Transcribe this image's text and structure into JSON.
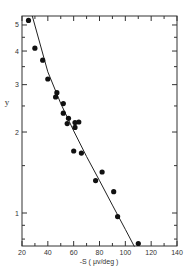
{
  "chart_data": {
    "type": "scatter",
    "title": "",
    "xlabel": "-S ( μv/deg )",
    "ylabel": "y",
    "xlim": [
      20,
      140
    ],
    "ylim": [
      0.75,
      5.4
    ],
    "yscale": "log",
    "grid": false,
    "legend": null,
    "x_ticks": [
      20,
      40,
      60,
      80,
      100,
      120,
      140
    ],
    "x_tick_labels": [
      "20",
      "40",
      "60",
      "80",
      "100",
      "120",
      "140"
    ],
    "y_ticks": [
      1,
      2,
      3,
      4,
      5
    ],
    "y_tick_labels": [
      "1",
      "2",
      "3",
      "4",
      "5"
    ],
    "series": [
      {
        "name": "data",
        "kind": "scatter",
        "x": [
          25,
          30,
          36,
          40,
          46,
          47,
          52,
          52,
          56,
          55,
          61,
          64,
          61,
          60,
          66,
          82,
          77,
          91,
          94,
          110
        ],
        "y": [
          5.2,
          4.1,
          3.7,
          3.15,
          2.7,
          2.8,
          2.55,
          2.35,
          2.25,
          2.15,
          2.17,
          2.18,
          2.08,
          1.7,
          1.67,
          1.42,
          1.32,
          1.2,
          0.97,
          0.77
        ]
      },
      {
        "name": "fit",
        "kind": "line",
        "x": [
          28,
          40,
          50,
          60,
          70,
          80,
          90,
          100,
          107
        ],
        "y": [
          5.4,
          3.35,
          2.55,
          2.02,
          1.62,
          1.32,
          1.07,
          0.87,
          0.75
        ]
      }
    ]
  }
}
